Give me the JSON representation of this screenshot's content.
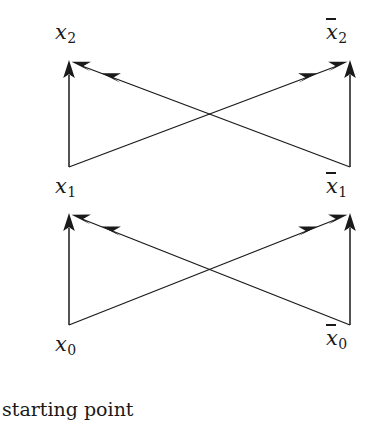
{
  "figure": {
    "background_color": "#ffffff",
    "stroke_color": "#1a1a1a",
    "labels": [
      {
        "name": "label-x2",
        "base": "x",
        "sub": "2",
        "bar": false,
        "x": 55,
        "y": 22
      },
      {
        "name": "label-xbar2",
        "base": "x",
        "sub": "2",
        "bar": true,
        "x": 326,
        "y": 22
      },
      {
        "name": "label-x1",
        "base": "x",
        "sub": "1",
        "bar": false,
        "x": 55,
        "y": 176
      },
      {
        "name": "label-xbar1",
        "base": "x",
        "sub": "1",
        "bar": true,
        "x": 326,
        "y": 176
      },
      {
        "name": "label-x0",
        "base": "x",
        "sub": "0",
        "bar": false,
        "x": 55,
        "y": 334
      },
      {
        "name": "label-xbar0",
        "base": "x",
        "sub": "0",
        "bar": true,
        "x": 326,
        "y": 328
      }
    ],
    "caption": {
      "text": "starting point",
      "x": 2,
      "y": 400
    },
    "geometry": {
      "left_x": 69,
      "right_x": 350,
      "level_y": [
        325,
        167,
        62
      ],
      "crossing_upper": {
        "x": 210,
        "y": 113
      },
      "crossing_lower": {
        "x": 210,
        "y": 266
      }
    },
    "edges": [
      {
        "name": "edge-x0-to-x1",
        "type": "vertical",
        "from": "x0",
        "to": "x1"
      },
      {
        "name": "edge-xbar0-to-xbar1",
        "type": "vertical",
        "from": "xbar0",
        "to": "xbar1"
      },
      {
        "name": "edge-xbar0-to-x1",
        "type": "diagonal",
        "from": "xbar0",
        "to": "x1"
      },
      {
        "name": "edge-x0-to-xbar1",
        "type": "diagonal",
        "from": "x0",
        "to": "xbar1"
      },
      {
        "name": "edge-x1-to-x2",
        "type": "vertical",
        "from": "x1",
        "to": "x2"
      },
      {
        "name": "edge-xbar1-to-xbar2",
        "type": "vertical",
        "from": "xbar1",
        "to": "xbar2"
      },
      {
        "name": "edge-xbar1-to-x2",
        "type": "diagonal",
        "from": "xbar1",
        "to": "x2"
      },
      {
        "name": "edge-x1-to-xbar2",
        "type": "diagonal",
        "from": "x1",
        "to": "xbar2"
      }
    ]
  }
}
